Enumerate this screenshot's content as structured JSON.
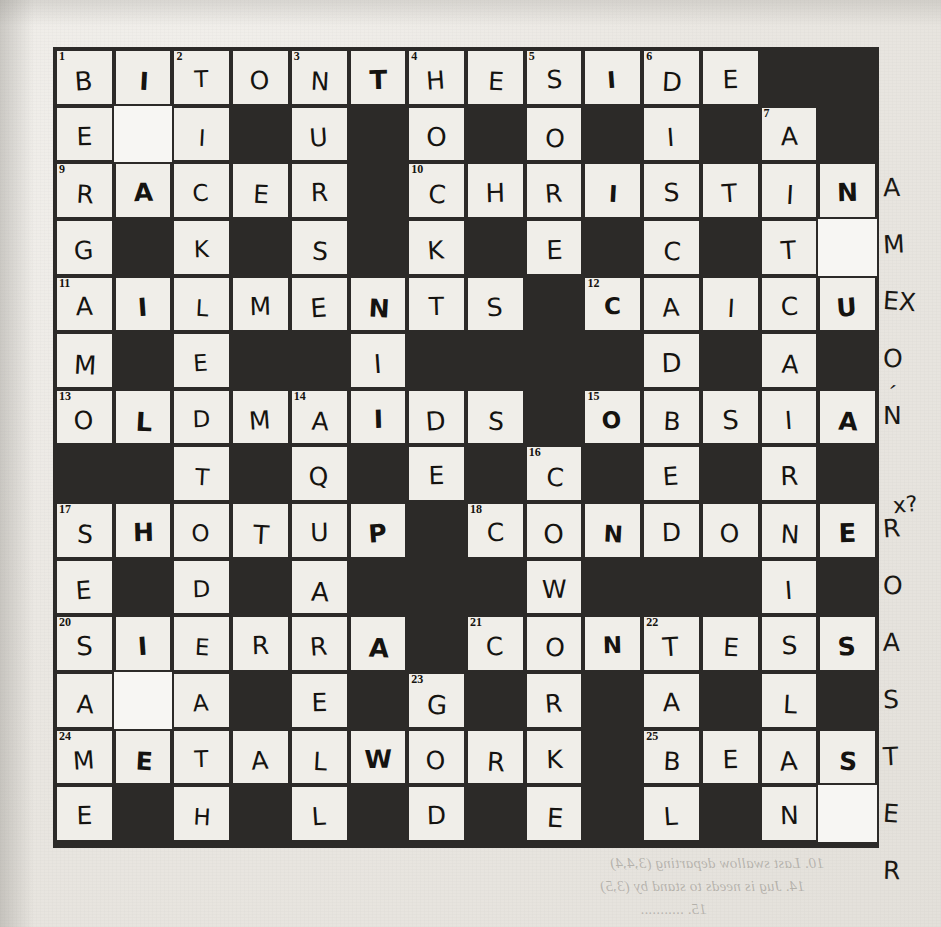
{
  "document": {
    "type": "scanned-crossword-worksheet",
    "title": "Handwritten crossword grid",
    "paper_color": "#ebe8e3",
    "ink_color": "#151310",
    "block_color": "#2c2a28"
  },
  "grid": {
    "columns": 14,
    "rows": 14,
    "legend": {
      "black": "blocked square",
      "white": "answer square",
      "blank": "erased / whited-out square"
    },
    "cells": [
      [
        {
          "t": "white",
          "n": "1",
          "l": "B"
        },
        {
          "t": "white",
          "l": "I"
        },
        {
          "t": "white",
          "n": "2",
          "l": "T"
        },
        {
          "t": "white",
          "l": "O"
        },
        {
          "t": "white",
          "n": "3",
          "l": "N"
        },
        {
          "t": "white",
          "l": "T"
        },
        {
          "t": "white",
          "n": "4",
          "l": "H"
        },
        {
          "t": "white",
          "l": "E"
        },
        {
          "t": "white",
          "n": "5",
          "l": "S"
        },
        {
          "t": "white",
          "l": "I"
        },
        {
          "t": "white",
          "n": "6",
          "l": "D"
        },
        {
          "t": "white",
          "l": "E"
        },
        {
          "t": "black"
        },
        {
          "t": "black"
        }
      ],
      [
        {
          "t": "white",
          "l": "E"
        },
        {
          "t": "blank"
        },
        {
          "t": "white",
          "l": "I"
        },
        {
          "t": "black"
        },
        {
          "t": "white",
          "l": "U"
        },
        {
          "t": "black"
        },
        {
          "t": "white",
          "l": "O"
        },
        {
          "t": "black"
        },
        {
          "t": "white",
          "l": "O"
        },
        {
          "t": "black"
        },
        {
          "t": "white",
          "l": "I"
        },
        {
          "t": "black"
        },
        {
          "t": "white",
          "n": "7",
          "l": "A"
        },
        {
          "t": "black"
        }
      ],
      [
        {
          "t": "white",
          "n": "9",
          "l": "R"
        },
        {
          "t": "white",
          "l": "A"
        },
        {
          "t": "white",
          "l": "C"
        },
        {
          "t": "white",
          "l": "E"
        },
        {
          "t": "white",
          "l": "R"
        },
        {
          "t": "black"
        },
        {
          "t": "white",
          "n": "10",
          "l": "C"
        },
        {
          "t": "white",
          "l": "H"
        },
        {
          "t": "white",
          "l": "R"
        },
        {
          "t": "white",
          "l": "I"
        },
        {
          "t": "white",
          "l": "S"
        },
        {
          "t": "white",
          "l": "T"
        },
        {
          "t": "white",
          "l": "I"
        },
        {
          "t": "white",
          "l": "N"
        }
      ],
      [
        {
          "t": "white",
          "l": "G"
        },
        {
          "t": "black"
        },
        {
          "t": "white",
          "l": "K"
        },
        {
          "t": "black"
        },
        {
          "t": "white",
          "l": "S"
        },
        {
          "t": "black"
        },
        {
          "t": "white",
          "l": "K"
        },
        {
          "t": "black"
        },
        {
          "t": "white",
          "l": "E"
        },
        {
          "t": "black"
        },
        {
          "t": "white",
          "l": "C"
        },
        {
          "t": "black"
        },
        {
          "t": "white",
          "l": "T"
        },
        {
          "t": "blank"
        }
      ],
      [
        {
          "t": "white",
          "n": "11",
          "l": "A"
        },
        {
          "t": "white",
          "l": "I"
        },
        {
          "t": "white",
          "l": "L"
        },
        {
          "t": "white",
          "l": "M"
        },
        {
          "t": "white",
          "l": "E"
        },
        {
          "t": "white",
          "l": "N"
        },
        {
          "t": "white",
          "l": "T"
        },
        {
          "t": "white",
          "l": "S"
        },
        {
          "t": "black"
        },
        {
          "t": "white",
          "n": "12",
          "l": "C"
        },
        {
          "t": "white",
          "l": "A"
        },
        {
          "t": "white",
          "l": "I"
        },
        {
          "t": "white",
          "l": "C"
        },
        {
          "t": "white",
          "l": "U"
        }
      ],
      [
        {
          "t": "white",
          "l": "M"
        },
        {
          "t": "black"
        },
        {
          "t": "white",
          "l": "E"
        },
        {
          "t": "black"
        },
        {
          "t": "black"
        },
        {
          "t": "white",
          "l": "I"
        },
        {
          "t": "black"
        },
        {
          "t": "black"
        },
        {
          "t": "black"
        },
        {
          "t": "black"
        },
        {
          "t": "white",
          "l": "D"
        },
        {
          "t": "black"
        },
        {
          "t": "white",
          "l": "A"
        },
        {
          "t": "black"
        }
      ],
      [
        {
          "t": "white",
          "n": "13",
          "l": "O"
        },
        {
          "t": "white",
          "l": "L"
        },
        {
          "t": "white",
          "l": "D"
        },
        {
          "t": "white",
          "l": "M"
        },
        {
          "t": "white",
          "n": "14",
          "l": "A"
        },
        {
          "t": "white",
          "l": "I"
        },
        {
          "t": "white",
          "l": "D"
        },
        {
          "t": "white",
          "l": "S"
        },
        {
          "t": "black"
        },
        {
          "t": "white",
          "n": "15",
          "l": "O"
        },
        {
          "t": "white",
          "l": "B"
        },
        {
          "t": "white",
          "l": "S"
        },
        {
          "t": "white",
          "l": "I"
        },
        {
          "t": "white",
          "l": "A"
        }
      ],
      [
        {
          "t": "black"
        },
        {
          "t": "black"
        },
        {
          "t": "white",
          "l": "T"
        },
        {
          "t": "black"
        },
        {
          "t": "white",
          "l": "Q"
        },
        {
          "t": "black"
        },
        {
          "t": "white",
          "l": "E"
        },
        {
          "t": "black"
        },
        {
          "t": "white",
          "n": "16",
          "l": "C"
        },
        {
          "t": "black"
        },
        {
          "t": "white",
          "l": "E"
        },
        {
          "t": "black"
        },
        {
          "t": "white",
          "l": "R"
        },
        {
          "t": "black"
        }
      ],
      [
        {
          "t": "white",
          "n": "17",
          "l": "S"
        },
        {
          "t": "white",
          "l": "H"
        },
        {
          "t": "white",
          "l": "O"
        },
        {
          "t": "white",
          "l": "T"
        },
        {
          "t": "white",
          "l": "U"
        },
        {
          "t": "white",
          "l": "P"
        },
        {
          "t": "black"
        },
        {
          "t": "white",
          "n": "18",
          "l": "C"
        },
        {
          "t": "white",
          "l": "O"
        },
        {
          "t": "white",
          "l": "N"
        },
        {
          "t": "white",
          "l": "D"
        },
        {
          "t": "white",
          "l": "O"
        },
        {
          "t": "white",
          "l": "N"
        },
        {
          "t": "white",
          "l": "E"
        }
      ],
      [
        {
          "t": "white",
          "l": "E"
        },
        {
          "t": "black"
        },
        {
          "t": "white",
          "l": "D"
        },
        {
          "t": "black"
        },
        {
          "t": "white",
          "l": "A"
        },
        {
          "t": "black"
        },
        {
          "t": "black"
        },
        {
          "t": "black"
        },
        {
          "t": "white",
          "l": "W"
        },
        {
          "t": "black"
        },
        {
          "t": "black"
        },
        {
          "t": "black"
        },
        {
          "t": "white",
          "l": "I"
        },
        {
          "t": "black"
        }
      ],
      [
        {
          "t": "white",
          "n": "20",
          "l": "S"
        },
        {
          "t": "white",
          "l": "I"
        },
        {
          "t": "white",
          "l": "E"
        },
        {
          "t": "white",
          "l": "R"
        },
        {
          "t": "white",
          "l": "R"
        },
        {
          "t": "white",
          "l": "A"
        },
        {
          "t": "black"
        },
        {
          "t": "white",
          "n": "21",
          "l": "C"
        },
        {
          "t": "white",
          "l": "O"
        },
        {
          "t": "white",
          "l": "N"
        },
        {
          "t": "white",
          "n": "22",
          "l": "T"
        },
        {
          "t": "white",
          "l": "E"
        },
        {
          "t": "white",
          "l": "S"
        },
        {
          "t": "white",
          "l": "S"
        }
      ],
      [
        {
          "t": "white",
          "l": "A"
        },
        {
          "t": "blank"
        },
        {
          "t": "white",
          "l": "A"
        },
        {
          "t": "black"
        },
        {
          "t": "white",
          "l": "E"
        },
        {
          "t": "black"
        },
        {
          "t": "white",
          "n": "23",
          "l": "G"
        },
        {
          "t": "black"
        },
        {
          "t": "white",
          "l": "R"
        },
        {
          "t": "black"
        },
        {
          "t": "white",
          "l": "A"
        },
        {
          "t": "black"
        },
        {
          "t": "white",
          "l": "L"
        },
        {
          "t": "black"
        }
      ],
      [
        {
          "t": "white",
          "n": "24",
          "l": "M"
        },
        {
          "t": "white",
          "l": "E"
        },
        {
          "t": "white",
          "l": "T"
        },
        {
          "t": "white",
          "l": "A"
        },
        {
          "t": "white",
          "l": "L"
        },
        {
          "t": "white",
          "l": "W"
        },
        {
          "t": "white",
          "l": "O"
        },
        {
          "t": "white",
          "l": "R"
        },
        {
          "t": "white",
          "l": "K"
        },
        {
          "t": "black"
        },
        {
          "t": "white",
          "n": "25",
          "l": "B"
        },
        {
          "t": "white",
          "l": "E"
        },
        {
          "t": "white",
          "l": "A"
        },
        {
          "t": "white",
          "l": "S"
        }
      ],
      [
        {
          "t": "white",
          "l": "E"
        },
        {
          "t": "black"
        },
        {
          "t": "white",
          "l": "H"
        },
        {
          "t": "black"
        },
        {
          "t": "white",
          "l": "L"
        },
        {
          "t": "black"
        },
        {
          "t": "white",
          "l": "D"
        },
        {
          "t": "black"
        },
        {
          "t": "white",
          "l": "E"
        },
        {
          "t": "black"
        },
        {
          "t": "white",
          "l": "L"
        },
        {
          "t": "black"
        },
        {
          "t": "white",
          "l": "N"
        },
        {
          "t": "blank"
        }
      ]
    ],
    "last_row": [
      {
        "t": "black"
      },
      {
        "t": "black"
      },
      {
        "t": "black"
      },
      {
        "t": "white",
        "n": "26",
        "l": "G"
      },
      {
        "t": "white",
        "l": "E"
      },
      {
        "t": "white",
        "l": "N"
      },
      {
        "t": "white",
        "l": "D"
      },
      {
        "t": "white",
        "l": "E"
      },
      {
        "t": "white",
        "l": "R"
      },
      {
        "t": "white",
        "l": "B"
      },
      {
        "t": "white",
        "l": "E"
      },
      {
        "t": "white",
        "l": "N"
      },
      {
        "t": "white",
        "l": "D"
      },
      {
        "t": "white",
        "l": "E"
      }
    ]
  },
  "overflow_letters": {
    "row3_col15": "A",
    "row4_col15": "M",
    "row5_col15": "EX",
    "row6_col15": "O",
    "row7_col15": "N",
    "row9_col15": "R",
    "row10_col15": "O",
    "row11_col15": "A",
    "row12_col15": "S",
    "row13_col15": "T",
    "row14_col15": "E",
    "row15_col15": "R"
  },
  "annotations": {
    "margin_mark_right": "x?",
    "tick_mark": "′"
  },
  "bleed_through": {
    "lines": [
      {
        "text": "10. Last swallow departing (3,4,4)",
        "x": 610,
        "y": 861
      },
      {
        "text": "14. Jug is needs to stand by (3,5)",
        "x": 600,
        "y": 884
      },
      {
        "text": "15. ...........",
        "x": 640,
        "y": 907
      }
    ]
  }
}
